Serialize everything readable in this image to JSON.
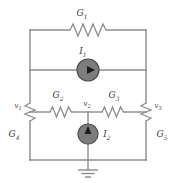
{
  "figure": {
    "type": "electrical-circuit-diagram",
    "background_color": "#ffffff",
    "wire_color": "#8c8c8c",
    "source_fill_color": "#7d7d7d",
    "label_color": "#3b3b3b"
  },
  "components": {
    "conductances": [
      {
        "id": "G1",
        "base": "G",
        "sub": "1",
        "orientation": "horizontal",
        "label": "G1"
      },
      {
        "id": "G2",
        "base": "G",
        "sub": "2",
        "orientation": "horizontal",
        "label": "G2"
      },
      {
        "id": "G3",
        "base": "G",
        "sub": "3",
        "orientation": "horizontal",
        "label": "G3"
      },
      {
        "id": "G4",
        "base": "G",
        "sub": "4",
        "orientation": "vertical",
        "label": "G4"
      },
      {
        "id": "G5",
        "base": "G",
        "sub": "5",
        "orientation": "vertical",
        "label": "G5"
      }
    ],
    "sources": [
      {
        "id": "I1",
        "base": "I",
        "sub": "1",
        "orientation": "horizontal",
        "arrow_direction": "right",
        "label": "I1"
      },
      {
        "id": "I2",
        "base": "I",
        "sub": "2",
        "orientation": "vertical",
        "arrow_direction": "up",
        "label": "I2"
      }
    ],
    "nodes": [
      {
        "id": "v1",
        "base": "v",
        "sub": "1",
        "label": "v1"
      },
      {
        "id": "v2",
        "base": "v",
        "sub": "2",
        "label": "v2"
      },
      {
        "id": "v3",
        "base": "v",
        "sub": "3",
        "label": "v3"
      }
    ],
    "ground": {
      "id": "ground",
      "symbol": "earth-ground",
      "label": ""
    }
  }
}
